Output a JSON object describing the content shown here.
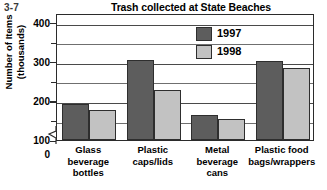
{
  "figure_number": "3-7",
  "chart_data": {
    "type": "bar",
    "title": "Trash collected at State Beaches",
    "xlabel": "",
    "ylabel": "Number of Items (thousands)",
    "ylabel_lines": [
      "Number of Items",
      "(thousands)"
    ],
    "ylim": [
      0,
      400
    ],
    "y_axis_break": true,
    "y_axis_break_between": [
      0,
      100
    ],
    "grid": true,
    "grid_interval": 50,
    "tick_labels": [
      "0",
      "100",
      "200",
      "300",
      "400"
    ],
    "tick_values": [
      0,
      100,
      200,
      300,
      400
    ],
    "minor_tick_values": [
      150,
      250,
      350
    ],
    "legend_position": "inside-top-right",
    "categories": [
      "Glass beverage bottles",
      "Plastic caps/lids",
      "Metal beverage cans",
      "Plastic food bags/wrappers"
    ],
    "category_label_lines": [
      [
        "Glass",
        "beverage",
        "bottles"
      ],
      [
        "Plastic",
        "caps/lids"
      ],
      [
        "Metal",
        "beverage",
        "cans"
      ],
      [
        "Plastic food",
        "bags/wrappers"
      ]
    ],
    "series": [
      {
        "name": "1997",
        "color": "#5d5d5d",
        "values": [
          193,
          305,
          165,
          302
        ]
      },
      {
        "name": "1998",
        "color": "#c2c2c2",
        "values": [
          177,
          227,
          155,
          285
        ]
      }
    ]
  },
  "colors": {
    "series_1997": "#5d5d5d",
    "series_1998": "#c2c2c2",
    "axis": "#2b2b2b",
    "gridline": "#6f6f6f",
    "background": "#ffffff"
  }
}
